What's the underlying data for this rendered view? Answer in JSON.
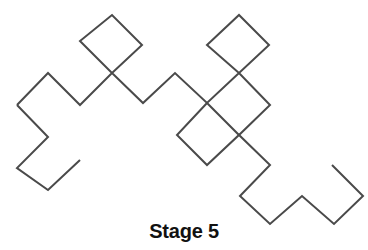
{
  "figure": {
    "caption": "Stage 5",
    "stage_number": 5,
    "stroke_color": "#4a4a4a",
    "background_color": "#ffffff",
    "stroke_width": 2,
    "canvas": {
      "width": 368,
      "height": 250
    },
    "curve": {
      "type": "quadratic-koch-island-segment",
      "description": "single open polyline of 45-degree diagonal segments",
      "segment_length": 32,
      "points": [
        [
          17,
          105
        ],
        [
          48,
          73
        ],
        [
          80,
          105
        ],
        [
          112,
          73
        ],
        [
          80,
          41
        ],
        [
          112,
          15
        ],
        [
          142,
          45
        ],
        [
          112,
          73
        ],
        [
          143,
          103
        ],
        [
          175,
          73
        ],
        [
          207,
          103
        ],
        [
          239,
          73
        ],
        [
          207,
          45
        ],
        [
          239,
          15
        ],
        [
          269,
          45
        ],
        [
          239,
          73
        ],
        [
          270,
          105
        ],
        [
          239,
          135
        ],
        [
          207,
          103
        ],
        [
          177,
          135
        ],
        [
          207,
          165
        ],
        [
          239,
          135
        ],
        [
          270,
          165
        ],
        [
          240,
          196
        ],
        [
          270,
          224
        ],
        [
          302,
          196
        ],
        [
          334,
          224
        ],
        [
          363,
          196
        ],
        [
          332,
          165
        ]
      ],
      "left_tail_points": [
        [
          17,
          105
        ],
        [
          48,
          137
        ],
        [
          17,
          168
        ],
        [
          48,
          190
        ],
        [
          80,
          160
        ]
      ]
    }
  }
}
